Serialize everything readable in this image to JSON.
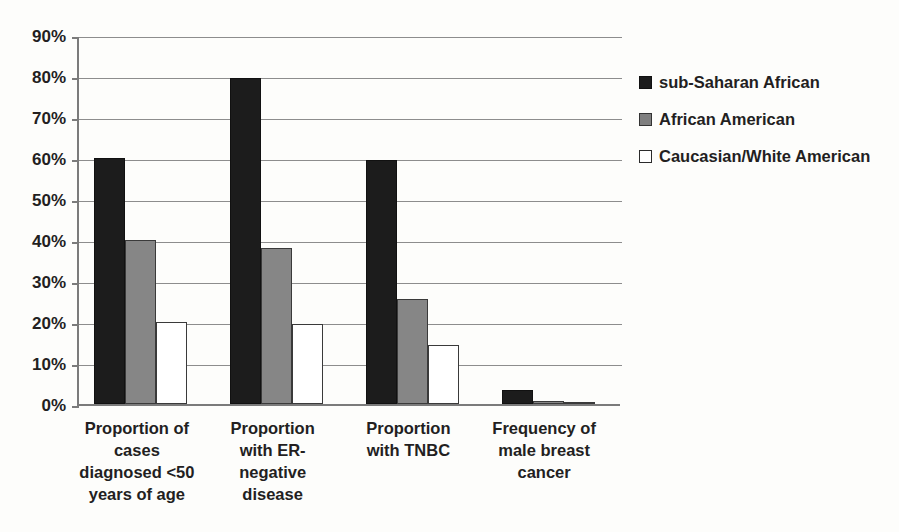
{
  "chart_data": {
    "type": "bar",
    "title": "",
    "subtitle": "",
    "xlabel": "",
    "ylabel": "",
    "ylim": [
      0,
      90
    ],
    "grid": true,
    "legend_position": "right",
    "ytick_labels": [
      "90%",
      "80%",
      "70%",
      "60%",
      "50%",
      "40%",
      "30%",
      "20%",
      "10%",
      "0%"
    ],
    "ytick_values": [
      90,
      80,
      70,
      60,
      50,
      40,
      30,
      20,
      10,
      0
    ],
    "categories": [
      "Proportion of cases diagnosed <50 years of age",
      "Proportion with ER-negative disease",
      "Proportion with TNBC",
      "Frequency of male breast cancer"
    ],
    "category_lines": [
      [
        "Proportion of",
        "cases",
        "diagnosed <50",
        "years of age"
      ],
      [
        "Proportion",
        "with ER-",
        "negative",
        "disease"
      ],
      [
        "Proportion",
        "with TNBC"
      ],
      [
        "Frequency of",
        "male breast",
        "cancer"
      ]
    ],
    "series": [
      {
        "name": "sub-Saharan African",
        "color": "#1c1c1c",
        "values": [
          60,
          79.5,
          59.5,
          3.5
        ]
      },
      {
        "name": "African American",
        "color": "#868686",
        "values": [
          40,
          38,
          25.5,
          0.8
        ]
      },
      {
        "name": "Caucasian/White American",
        "color": "#ffffff",
        "values": [
          20,
          19.5,
          14.5,
          0.3
        ]
      }
    ]
  },
  "legend": {
    "items": [
      {
        "label": "sub-Saharan African",
        "swatch": "black-square-icon"
      },
      {
        "label": "African American",
        "swatch": "gray-square-icon"
      },
      {
        "label": "Caucasian/White American",
        "swatch": "white-square-icon"
      }
    ]
  }
}
